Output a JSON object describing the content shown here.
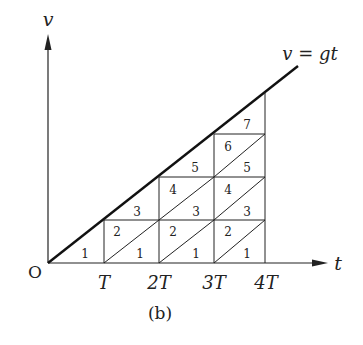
{
  "figure": {
    "caption": "(b)",
    "axes": {
      "y_label": "v",
      "x_label": "t",
      "origin_label": "O",
      "x_ticks": [
        "T",
        "2T",
        "3T",
        "4T"
      ]
    },
    "line_label": "v = gt",
    "region_labels": {
      "col1": [
        "1"
      ],
      "col2": [
        "1",
        "2",
        "3"
      ],
      "col3": [
        "1",
        "2",
        "3",
        "4",
        "5"
      ],
      "col4": [
        "1",
        "2",
        "3",
        "4",
        "5",
        "6",
        "7"
      ]
    },
    "colors": {
      "stroke": "#222222",
      "background": "#ffffff"
    }
  }
}
